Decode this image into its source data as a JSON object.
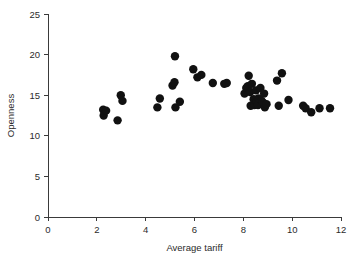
{
  "figure": {
    "background_color": "#ffffff",
    "point_color": "#111111",
    "axis_color": "#3a3a3a"
  },
  "chart_data": {
    "type": "scatter",
    "title": "",
    "xlabel": "Average tariff",
    "ylabel": "Openness",
    "xlim": [
      0,
      12
    ],
    "ylim": [
      0,
      25
    ],
    "xticks": [
      0,
      2,
      4,
      6,
      8,
      10,
      12
    ],
    "yticks": [
      0,
      5,
      10,
      15,
      20,
      25
    ],
    "xtick_labels": [
      "0",
      "2",
      "4",
      "6",
      "8",
      "10",
      "12"
    ],
    "ytick_labels": [
      "0",
      "5",
      "10",
      "15",
      "20",
      "25"
    ],
    "grid": false,
    "legend": null,
    "marker": "filled-circle",
    "marker_size": 4.6,
    "points": [
      {
        "x": 2.26,
        "y": 13.2
      },
      {
        "x": 2.28,
        "y": 12.5
      },
      {
        "x": 2.38,
        "y": 13.1
      },
      {
        "x": 2.85,
        "y": 11.9
      },
      {
        "x": 2.98,
        "y": 15.0
      },
      {
        "x": 3.05,
        "y": 14.3
      },
      {
        "x": 4.48,
        "y": 13.5
      },
      {
        "x": 4.58,
        "y": 14.6
      },
      {
        "x": 5.1,
        "y": 16.2
      },
      {
        "x": 5.18,
        "y": 16.6
      },
      {
        "x": 5.2,
        "y": 19.8
      },
      {
        "x": 5.22,
        "y": 13.5
      },
      {
        "x": 5.4,
        "y": 14.2
      },
      {
        "x": 5.95,
        "y": 18.2
      },
      {
        "x": 6.12,
        "y": 17.2
      },
      {
        "x": 6.28,
        "y": 17.5
      },
      {
        "x": 6.75,
        "y": 16.5
      },
      {
        "x": 7.22,
        "y": 16.4
      },
      {
        "x": 7.32,
        "y": 16.5
      },
      {
        "x": 8.05,
        "y": 15.2
      },
      {
        "x": 8.12,
        "y": 15.9
      },
      {
        "x": 8.18,
        "y": 16.1
      },
      {
        "x": 8.22,
        "y": 17.4
      },
      {
        "x": 8.28,
        "y": 15.4
      },
      {
        "x": 8.3,
        "y": 13.7
      },
      {
        "x": 8.35,
        "y": 16.4
      },
      {
        "x": 8.42,
        "y": 14.5
      },
      {
        "x": 8.45,
        "y": 13.8
      },
      {
        "x": 8.52,
        "y": 15.6
      },
      {
        "x": 8.55,
        "y": 14.2
      },
      {
        "x": 8.6,
        "y": 13.8
      },
      {
        "x": 8.62,
        "y": 14.6
      },
      {
        "x": 8.7,
        "y": 15.9
      },
      {
        "x": 8.75,
        "y": 14.3
      },
      {
        "x": 8.8,
        "y": 14.1
      },
      {
        "x": 8.85,
        "y": 15.2
      },
      {
        "x": 8.88,
        "y": 13.5
      },
      {
        "x": 8.95,
        "y": 13.9
      },
      {
        "x": 9.38,
        "y": 16.8
      },
      {
        "x": 9.45,
        "y": 13.7
      },
      {
        "x": 9.58,
        "y": 17.7
      },
      {
        "x": 9.85,
        "y": 14.4
      },
      {
        "x": 10.45,
        "y": 13.7
      },
      {
        "x": 10.55,
        "y": 13.4
      },
      {
        "x": 10.78,
        "y": 12.9
      },
      {
        "x": 11.12,
        "y": 13.4
      },
      {
        "x": 11.55,
        "y": 13.4
      }
    ]
  }
}
